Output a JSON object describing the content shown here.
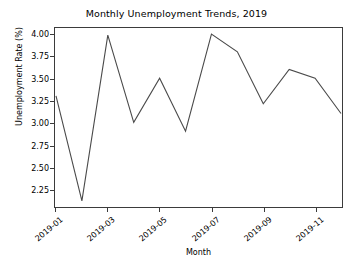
{
  "chart_data": {
    "type": "line",
    "title": "Monthly Unemployment Trends, 2019",
    "xlabel": "Month",
    "ylabel": "Unemployment Rate (%)",
    "grid": false,
    "legend": "none",
    "line_color": "#4a4a4a",
    "categories": [
      "2019-01",
      "2019-02",
      "2019-03",
      "2019-04",
      "2019-05",
      "2019-06",
      "2019-07",
      "2019-08",
      "2019-09",
      "2019-10",
      "2019-11",
      "2019-12"
    ],
    "values": [
      3.31,
      2.12,
      4.0,
      3.01,
      3.51,
      2.91,
      4.01,
      3.81,
      3.22,
      3.61,
      3.51,
      3.11
    ],
    "ylim": [
      2.05,
      4.08
    ],
    "yticks": [
      2.25,
      2.5,
      2.75,
      3.0,
      3.25,
      3.5,
      3.75,
      4.0
    ],
    "ytick_labels": [
      "2.25",
      "2.50",
      "2.75",
      "3.00",
      "3.25",
      "3.50",
      "3.75",
      "4.00"
    ],
    "xticks": [
      0,
      2,
      4,
      6,
      8,
      10
    ],
    "xtick_labels": [
      "2019-01",
      "2019-03",
      "2019-05",
      "2019-07",
      "2019-09",
      "2019-11"
    ]
  }
}
